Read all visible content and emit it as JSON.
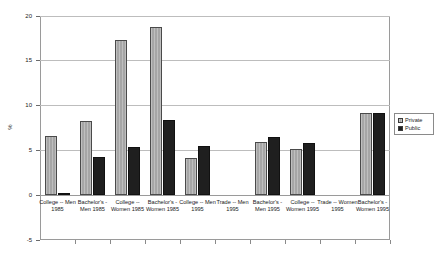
{
  "chart_data": {
    "type": "bar",
    "title": "",
    "xlabel": "",
    "ylabel": "%",
    "ylim": [
      -5,
      20
    ],
    "yticks": [
      20,
      15,
      10,
      5,
      0,
      -5
    ],
    "grid": true,
    "legend_position": "right",
    "categories": [
      "College -- Men 1985",
      "Bachelor's - Men 1985",
      "College -- Women 1985",
      "Bachelor's - Women 1985",
      "College -- Men 1995",
      "Trade -- Men 1995",
      "Bachelor's - Men 1995",
      "College -- Women 1995",
      "Trade -- Women 1995",
      "Bachelor's - Women 1995"
    ],
    "series": [
      {
        "name": "Private",
        "color": "#a6a6a6",
        "values": [
          6.6,
          8.3,
          17.3,
          18.8,
          4.2,
          null,
          5.9,
          5.2,
          null,
          9.2
        ]
      },
      {
        "name": "Public",
        "color": "#1f1f1f",
        "values": [
          0.0,
          4.3,
          5.4,
          8.4,
          5.5,
          null,
          6.5,
          5.8,
          null,
          9.2
        ]
      }
    ]
  },
  "legend": {
    "items": [
      {
        "label": "Private",
        "swatch": "private"
      },
      {
        "label": "Public",
        "swatch": "public"
      }
    ]
  },
  "axis": {
    "y_title": "%",
    "y_tick_labels": [
      "20",
      "15",
      "10",
      "5",
      "0",
      "-5"
    ]
  }
}
